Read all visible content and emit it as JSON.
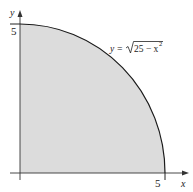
{
  "figure": {
    "axes": {
      "x_label": "x",
      "y_label": "y",
      "x_tick_label": "5",
      "y_tick_label": "5"
    },
    "curve_label": {
      "prefix": "y = ",
      "radicand": "25 − x",
      "exponent": "2"
    },
    "colors": {
      "fill": "#dcdcdc",
      "curve": "#1a1a1a",
      "axis": "#333333"
    }
  }
}
